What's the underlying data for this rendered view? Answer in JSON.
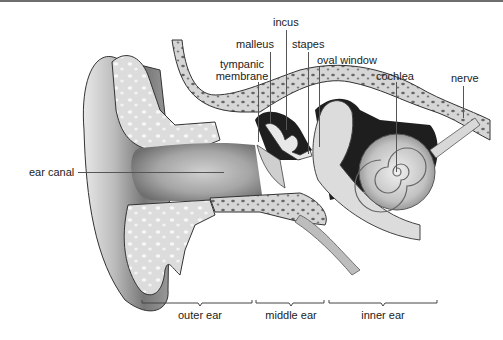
{
  "diagram": {
    "labels": {
      "incus": "incus",
      "malleus": "malleus",
      "stapes": "stapes",
      "oval_window": "oval window",
      "tympanic_membrane_line1": "tympanic",
      "tympanic_membrane_line2": "membrane",
      "cochlea": "cochlea",
      "nerve": "nerve",
      "ear_canal": "ear canal"
    },
    "regions": [
      {
        "label": "outer ear"
      },
      {
        "label": "middle ear"
      },
      {
        "label": "inner ear"
      }
    ],
    "colors": {
      "background": "#ffffff",
      "bone": "#d9d9d9",
      "bone_pores": "#6a6a6a",
      "cartilage": "#e6e6e6",
      "skin": "#a9a9a9",
      "cavity": "#1e1e1e",
      "text": "#222222",
      "leader": "#555555"
    }
  }
}
